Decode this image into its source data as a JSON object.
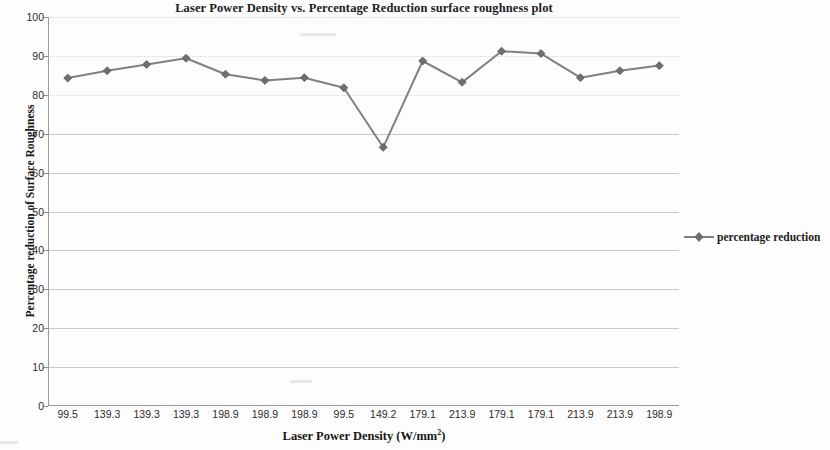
{
  "chart_data": {
    "type": "line",
    "title": "Laser Power Density vs. Percentage Reduction surface roughness plot",
    "xlabel": "Laser Power Density (W/mm²)",
    "ylabel": "Percentage reduction of Surface Roughness",
    "categories": [
      "99.5",
      "139.3",
      "139.3",
      "139.3",
      "198.9",
      "198.9",
      "198.9",
      "99.5",
      "149.2",
      "179.1",
      "213.9",
      "179.1",
      "179.1",
      "213.9",
      "213.9",
      "198.9"
    ],
    "series": [
      {
        "name": "percentage reduction",
        "color": "#808080",
        "marker": "diamond",
        "values": [
          84.3,
          86.2,
          87.8,
          89.4,
          85.3,
          83.7,
          84.4,
          81.8,
          66.5,
          88.7,
          83.2,
          91.2,
          90.6,
          84.4,
          86.2,
          87.5
        ]
      }
    ],
    "ylim": [
      0,
      100
    ],
    "y_ticks": [
      0,
      10,
      20,
      30,
      40,
      50,
      60,
      70,
      80,
      90,
      100
    ],
    "y_tick_labels": [
      "0",
      "10",
      "20",
      "30",
      "40",
      "50",
      "60",
      "70",
      "80",
      "90",
      "100"
    ],
    "grid": true,
    "grid_axis": "y",
    "legend_position": "right",
    "legend_entries": [
      "percentage reduction"
    ]
  },
  "legend": {
    "marker_icon": "diamond-marker-icon",
    "label": "percentage reduction"
  }
}
